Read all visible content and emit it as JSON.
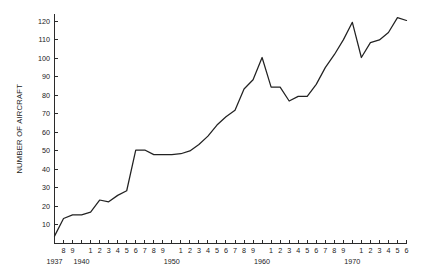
{
  "chart_data": {
    "type": "line",
    "title": "",
    "subtitle": "",
    "xlabel": "",
    "ylabel": "NUMBER OF AIRCRAFT",
    "xlim": [
      1937,
      1976
    ],
    "ylim": [
      0,
      124
    ],
    "grid": false,
    "legend": null,
    "legend_position": "none",
    "y_ticks": [
      10,
      20,
      30,
      40,
      50,
      60,
      70,
      80,
      90,
      100,
      110,
      120
    ],
    "y_tick_labels": [
      "10",
      "20",
      "30",
      "40",
      "50",
      "60",
      "70",
      "80",
      "90",
      "100",
      "110",
      "120"
    ],
    "x_ticks": [
      1937,
      1938,
      1939,
      1940,
      1941,
      1942,
      1943,
      1944,
      1945,
      1946,
      1947,
      1948,
      1949,
      1950,
      1951,
      1952,
      1953,
      1954,
      1955,
      1956,
      1957,
      1958,
      1959,
      1960,
      1961,
      1962,
      1963,
      1964,
      1965,
      1966,
      1967,
      1968,
      1969,
      1970,
      1971,
      1972,
      1973,
      1974,
      1975,
      1976
    ],
    "x_tick_labels": [
      "",
      "8",
      "9",
      "",
      "1",
      "2",
      "3",
      "4",
      "5",
      "6",
      "7",
      "8",
      "9",
      "",
      "1",
      "2",
      "3",
      "4",
      "5",
      "6",
      "7",
      "8",
      "9",
      "",
      "1",
      "2",
      "3",
      "4",
      "5",
      "6",
      "7",
      "8",
      "9",
      "",
      "1",
      "2",
      "3",
      "4",
      "5",
      "6"
    ],
    "decade_labels": [
      {
        "year": 1937,
        "text": "1937"
      },
      {
        "year": 1940,
        "text": "1940"
      },
      {
        "year": 1950,
        "text": "1950"
      },
      {
        "year": 1960,
        "text": "1960"
      },
      {
        "year": 1970,
        "text": "1970"
      }
    ],
    "x": [
      1937,
      1938,
      1939,
      1940,
      1941,
      1942,
      1943,
      1944,
      1945,
      1946,
      1947,
      1948,
      1949,
      1950,
      1951,
      1952,
      1953,
      1954,
      1955,
      1956,
      1957,
      1958,
      1959,
      1960,
      1961,
      1962,
      1963,
      1964,
      1965,
      1966,
      1967,
      1968,
      1969,
      1970,
      1971,
      1972,
      1973,
      1974,
      1975,
      1976
    ],
    "values": [
      4,
      13.5,
      15.5,
      15.5,
      17,
      23.5,
      22.5,
      26,
      28.5,
      50.5,
      50.5,
      48,
      48,
      48,
      48.5,
      50,
      53.5,
      58,
      64,
      68.5,
      72,
      83.5,
      88.5,
      100.5,
      84.5,
      84.5,
      77,
      79.5,
      79.5,
      86,
      95,
      102,
      110,
      119.5,
      100.5,
      108.5,
      110,
      114,
      122,
      120.5
    ],
    "series": [
      {
        "name": "Number of aircraft",
        "color": "#222222",
        "values": [
          4,
          13.5,
          15.5,
          15.5,
          17,
          23.5,
          22.5,
          26,
          28.5,
          50.5,
          50.5,
          48,
          48,
          48,
          48.5,
          50,
          53.5,
          58,
          64,
          68.5,
          72,
          83.5,
          88.5,
          100.5,
          84.5,
          84.5,
          77,
          79.5,
          79.5,
          86,
          95,
          102,
          110,
          119.5,
          100.5,
          108.5,
          110,
          114,
          122,
          120.5
        ]
      }
    ]
  },
  "style": {
    "line_color": "#222222",
    "axis_color": "#2b2b2b",
    "text_color": "#1a1a1a",
    "background": "#ffffff"
  }
}
